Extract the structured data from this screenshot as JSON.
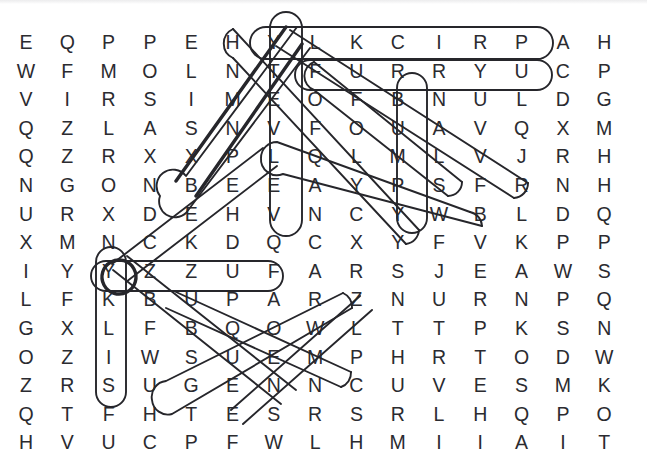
{
  "puzzle": {
    "title": "Word Search Grid",
    "type": "word-search",
    "rows": 15,
    "cols": 15,
    "stroke_color": "#26262b",
    "letter_color": "#2b2b30",
    "background_color": "#ffffff",
    "grid": [
      [
        "E",
        "Q",
        "P",
        "P",
        "E",
        "H",
        "Y",
        "L",
        "K",
        "C",
        "I",
        "R",
        "P",
        "A",
        "H"
      ],
      [
        "W",
        "F",
        "M",
        "O",
        "L",
        "N",
        "T",
        "F",
        "U",
        "R",
        "R",
        "Y",
        "U",
        "C",
        "P"
      ],
      [
        "V",
        "I",
        "R",
        "S",
        "I",
        "M",
        "E",
        "O",
        "F",
        "B",
        "N",
        "U",
        "L",
        "D",
        "G"
      ],
      [
        "Q",
        "Z",
        "L",
        "A",
        "S",
        "N",
        "V",
        "F",
        "O",
        "U",
        "A",
        "V",
        "Q",
        "X",
        "M"
      ],
      [
        "Q",
        "Z",
        "R",
        "X",
        "X",
        "P",
        "L",
        "Q",
        "L",
        "M",
        "L",
        "V",
        "J",
        "R",
        "H"
      ],
      [
        "N",
        "G",
        "O",
        "N",
        "B",
        "E",
        "E",
        "A",
        "Y",
        "P",
        "S",
        "F",
        "R",
        "N",
        "H"
      ],
      [
        "U",
        "R",
        "X",
        "D",
        "E",
        "H",
        "V",
        "N",
        "C",
        "Y",
        "W",
        "B",
        "L",
        "D",
        "Q"
      ],
      [
        "X",
        "M",
        "N",
        "C",
        "K",
        "D",
        "Q",
        "C",
        "X",
        "Y",
        "F",
        "V",
        "K",
        "P",
        "P"
      ],
      [
        "I",
        "Y",
        "Y",
        "Z",
        "Z",
        "U",
        "F",
        "A",
        "R",
        "S",
        "J",
        "E",
        "A",
        "W",
        "S"
      ],
      [
        "L",
        "F",
        "K",
        "B",
        "U",
        "P",
        "A",
        "R",
        "Z",
        "N",
        "U",
        "R",
        "N",
        "P",
        "Q"
      ],
      [
        "G",
        "X",
        "L",
        "F",
        "B",
        "Q",
        "O",
        "W",
        "L",
        "T",
        "T",
        "P",
        "K",
        "S",
        "N"
      ],
      [
        "O",
        "Z",
        "I",
        "W",
        "S",
        "U",
        "E",
        "M",
        "P",
        "H",
        "R",
        "T",
        "O",
        "D",
        "W"
      ],
      [
        "Z",
        "R",
        "S",
        "U",
        "G",
        "E",
        "N",
        "N",
        "C",
        "U",
        "V",
        "E",
        "S",
        "M",
        "K"
      ],
      [
        "Q",
        "T",
        "F",
        "H",
        "T",
        "E",
        "S",
        "R",
        "S",
        "R",
        "L",
        "H",
        "Q",
        "P",
        "O"
      ],
      [
        "H",
        "V",
        "U",
        "C",
        "P",
        "F",
        "W",
        "L",
        "H",
        "M",
        "I",
        "I",
        "A",
        "I",
        "T"
      ]
    ],
    "found_words": [
      {
        "word": "PRICKLY",
        "direction": "horizontal-reversed",
        "row": 1,
        "start_col": 13,
        "end_col": 7,
        "style": "normal"
      },
      {
        "word": "FURRY",
        "direction": "horizontal",
        "row": 2,
        "start_col": 8,
        "end_col": 12,
        "style": "normal"
      },
      {
        "word": "FUZZY",
        "direction": "horizontal-reversed",
        "row": 9,
        "start_col": 7,
        "end_col": 3,
        "style": "normal"
      },
      {
        "word": "VELVETY",
        "direction": "vertical-reversed",
        "col": 7,
        "start_row": 7,
        "end_row": 1,
        "style": "normal"
      },
      {
        "word": "BUMPY",
        "direction": "vertical",
        "col": 10,
        "start_row": 3,
        "end_row": 7,
        "style": "normal"
      },
      {
        "word": "SILKY",
        "direction": "vertical-reversed",
        "col": 3,
        "start_row": 13,
        "end_row": 9,
        "style": "normal"
      },
      {
        "word": "HAIRY",
        "direction": "diagonal-down-right",
        "start_row": 1,
        "start_col": 6,
        "end_row": 8,
        "end_col": 10,
        "style": "normal"
      },
      {
        "word": "SMOOTH",
        "direction": "diagonal-up-right",
        "start_row": 6,
        "start_col": 2,
        "end_row": 1,
        "end_col": 7,
        "style": "bold"
      },
      {
        "word": "ROUGH",
        "direction": "diagonal-up-right",
        "start_row": 9,
        "start_col": 3,
        "end_row": 4,
        "end_col": 8,
        "style": "normal"
      },
      {
        "word": "SOFT",
        "direction": "diagonal-down-right",
        "start_row": 4,
        "start_col": 7,
        "end_row": 8,
        "end_col": 11,
        "style": "normal"
      },
      {
        "word": "FLUFFY",
        "direction": "diagonal-up-right",
        "start_row": 9,
        "start_col": 3,
        "end_row": 4,
        "end_col": 8,
        "style": "normal"
      },
      {
        "word": "COARSE",
        "direction": "diagonal-down-right",
        "start_row": 10,
        "start_col": 4,
        "end_row": 13,
        "end_col": 8,
        "style": "normal"
      },
      {
        "word": "SLICK",
        "direction": "diagonal-up-right",
        "start_row": 14,
        "start_col": 4,
        "end_row": 10,
        "end_col": 8,
        "style": "normal"
      }
    ]
  }
}
